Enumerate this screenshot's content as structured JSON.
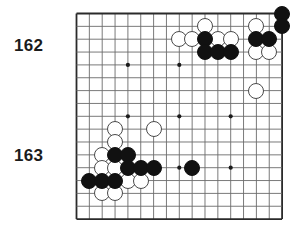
{
  "figure": {
    "type": "go-board-diagram",
    "title": "",
    "board": {
      "columns": 17,
      "rows": 17,
      "line_color": "#6b6b6b",
      "border_color": "#2a2a2a",
      "background_color": "#ffffff",
      "star_points": [
        {
          "col": 4,
          "row": 4
        },
        {
          "col": 8,
          "row": 4
        },
        {
          "col": 4,
          "row": 8
        },
        {
          "col": 8,
          "row": 8
        },
        {
          "col": 12,
          "row": 8
        },
        {
          "col": 8,
          "row": 12
        },
        {
          "col": 12,
          "row": 12
        }
      ]
    },
    "move_labels": [
      {
        "text": "162",
        "x": 14,
        "y": 36
      },
      {
        "text": "163",
        "x": 14,
        "y": 146
      }
    ],
    "stone_colors": {
      "black": "#111111",
      "white": "#ffffff",
      "white_outline": "#4a4a4a"
    },
    "stones": [
      {
        "col": 16,
        "row": 0,
        "color": "black"
      },
      {
        "col": 14,
        "row": 1,
        "color": "white"
      },
      {
        "col": 16,
        "row": 1,
        "color": "black"
      },
      {
        "col": 10,
        "row": 1,
        "color": "white"
      },
      {
        "col": 8,
        "row": 2,
        "color": "white"
      },
      {
        "col": 9,
        "row": 2,
        "color": "white"
      },
      {
        "col": 10,
        "row": 2,
        "color": "black"
      },
      {
        "col": 11,
        "row": 2,
        "color": "white"
      },
      {
        "col": 12,
        "row": 2,
        "color": "white"
      },
      {
        "col": 14,
        "row": 2,
        "color": "black"
      },
      {
        "col": 15,
        "row": 2,
        "color": "black"
      },
      {
        "col": 10,
        "row": 3,
        "color": "black"
      },
      {
        "col": 11,
        "row": 3,
        "color": "black"
      },
      {
        "col": 12,
        "row": 3,
        "color": "black"
      },
      {
        "col": 14,
        "row": 3,
        "color": "white"
      },
      {
        "col": 15,
        "row": 3,
        "color": "white"
      },
      {
        "col": 14,
        "row": 6,
        "color": "white"
      },
      {
        "col": 3,
        "row": 9,
        "color": "white"
      },
      {
        "col": 6,
        "row": 9,
        "color": "white"
      },
      {
        "col": 3,
        "row": 10,
        "color": "white"
      },
      {
        "col": 2,
        "row": 11,
        "color": "white"
      },
      {
        "col": 3,
        "row": 11,
        "color": "black"
      },
      {
        "col": 4,
        "row": 11,
        "color": "black"
      },
      {
        "col": 2,
        "row": 12,
        "color": "white"
      },
      {
        "col": 3,
        "row": 12,
        "color": "white"
      },
      {
        "col": 4,
        "row": 12,
        "color": "black"
      },
      {
        "col": 5,
        "row": 12,
        "color": "black"
      },
      {
        "col": 6,
        "row": 12,
        "color": "black"
      },
      {
        "col": 9,
        "row": 12,
        "color": "black"
      },
      {
        "col": 1,
        "row": 13,
        "color": "black"
      },
      {
        "col": 2,
        "row": 13,
        "color": "black"
      },
      {
        "col": 3,
        "row": 13,
        "color": "black"
      },
      {
        "col": 4,
        "row": 13,
        "color": "white"
      },
      {
        "col": 5,
        "row": 13,
        "color": "white"
      },
      {
        "col": 2,
        "row": 14,
        "color": "white"
      },
      {
        "col": 3,
        "row": 14,
        "color": "white"
      }
    ]
  }
}
